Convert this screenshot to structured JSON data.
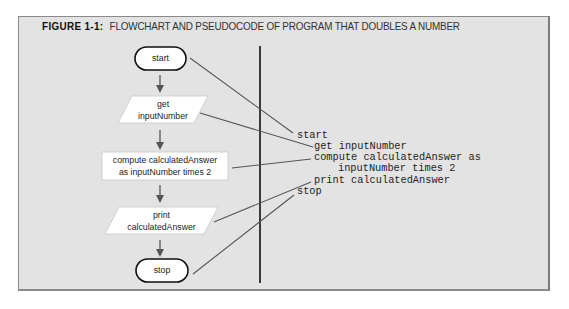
{
  "figure": {
    "label": "FIGURE 1-1:",
    "title": "FLOWCHART AND PSEUDOCODE OF PROGRAM THAT DOUBLES A NUMBER"
  },
  "flowchart": {
    "shapes": [
      {
        "type": "terminal",
        "lines": [
          "start"
        ]
      },
      {
        "type": "io",
        "lines": [
          "get",
          "inputNumber"
        ]
      },
      {
        "type": "process",
        "lines": [
          "compute calculatedAnswer",
          "as inputNumber times 2"
        ]
      },
      {
        "type": "io",
        "lines": [
          "print",
          "calculatedAnswer"
        ]
      },
      {
        "type": "terminal",
        "lines": [
          "stop"
        ]
      }
    ]
  },
  "pseudocode": {
    "lines": [
      "start",
      "get inputNumber",
      "compute calculatedAnswer as",
      "inputNumber times 2",
      "print calculatedAnswer",
      "stop"
    ]
  },
  "colors": {
    "background": "#e3e3e3",
    "shape_fill": "#ffffff",
    "stroke": "#1a1a1a",
    "connector": "#555555"
  }
}
